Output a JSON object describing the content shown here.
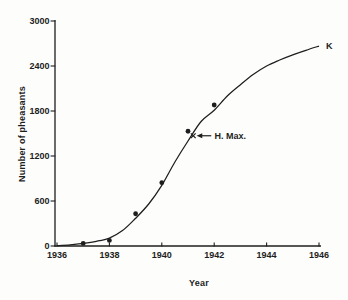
{
  "figure": {
    "background": "#fdfdfc",
    "ink_color": "#1e1e1e"
  },
  "chart_data": {
    "type": "scatter",
    "title": "",
    "xlabel": "Year",
    "ylabel": "Number of pheasants",
    "xlim": [
      1936,
      1946
    ],
    "ylim": [
      0,
      3000
    ],
    "grid": false,
    "legend": "none",
    "x_ticks": [
      1936,
      1938,
      1940,
      1942,
      1944,
      1946
    ],
    "y_ticks": [
      0,
      600,
      1200,
      1800,
      2400,
      3000
    ],
    "points": {
      "marker": "filled-circle",
      "x": [
        1937,
        1938,
        1939,
        1940,
        1941,
        1942
      ],
      "y": [
        35,
        75,
        430,
        845,
        1530,
        1880
      ]
    },
    "fitted_curve": {
      "shape": "logistic-sigmoid",
      "x": [
        1936.0,
        1936.5,
        1937.0,
        1937.5,
        1938.0,
        1938.5,
        1939.0,
        1939.5,
        1940.0,
        1940.5,
        1941.0,
        1941.5,
        1942.0,
        1942.5,
        1943.0,
        1943.5,
        1944.0,
        1944.5,
        1945.0,
        1945.5,
        1946.0
      ],
      "y": [
        5,
        15,
        35,
        62,
        105,
        205,
        370,
        560,
        810,
        1120,
        1400,
        1660,
        1810,
        2000,
        2150,
        2290,
        2400,
        2480,
        2550,
        2610,
        2665
      ]
    },
    "annotations": [
      {
        "label": "K",
        "type": "text-at-curve-end",
        "x": 1946.3,
        "y": 2665
      },
      {
        "label": "H. Max.",
        "type": "arrow-to-x-marker",
        "marker_x": 1941.2,
        "marker_y": 1470
      }
    ]
  }
}
